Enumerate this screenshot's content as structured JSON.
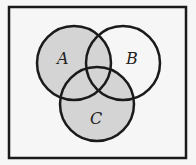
{
  "diagram": {
    "type": "venn",
    "sets": [
      {
        "name": "A",
        "label": "A",
        "cx": 74,
        "cy": 63,
        "r": 37
      },
      {
        "name": "B",
        "label": "B",
        "cx": 123,
        "cy": 63,
        "r": 37
      },
      {
        "name": "C",
        "label": "C",
        "cx": 97,
        "cy": 104,
        "r": 37
      }
    ],
    "shaded_region": "A ∪ C",
    "colors": {
      "shade": "#d4d4d4",
      "stroke": "#1a1a1a",
      "background": "#f6f6f6"
    }
  }
}
